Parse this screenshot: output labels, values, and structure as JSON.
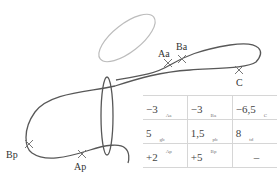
{
  "diagram": {
    "labels": {
      "Aa": "Aa",
      "Ba": "Ba",
      "C": "C",
      "Bp": "Bp",
      "Ap": "Ap"
    },
    "colors": {
      "strand": "#585858",
      "upper_ellipse": "#bcbcbc",
      "vertical_ellipse": "#585858",
      "table_border": "#d6d6d6"
    }
  },
  "table": {
    "rows": [
      [
        {
          "value": "−3",
          "sub": "Aa"
        },
        {
          "value": "−3",
          "sub": "Ba"
        },
        {
          "value": "−6,5",
          "sub": "C"
        }
      ],
      [
        {
          "value": "5",
          "sub": "gb"
        },
        {
          "value": "1,5",
          "sub": "pb"
        },
        {
          "value": "8",
          "sub": "td"
        }
      ],
      [
        {
          "value": "+2",
          "sup": "Ap"
        },
        {
          "value": "+5",
          "sup": "Bp"
        },
        {
          "value": "–"
        }
      ]
    ]
  }
}
